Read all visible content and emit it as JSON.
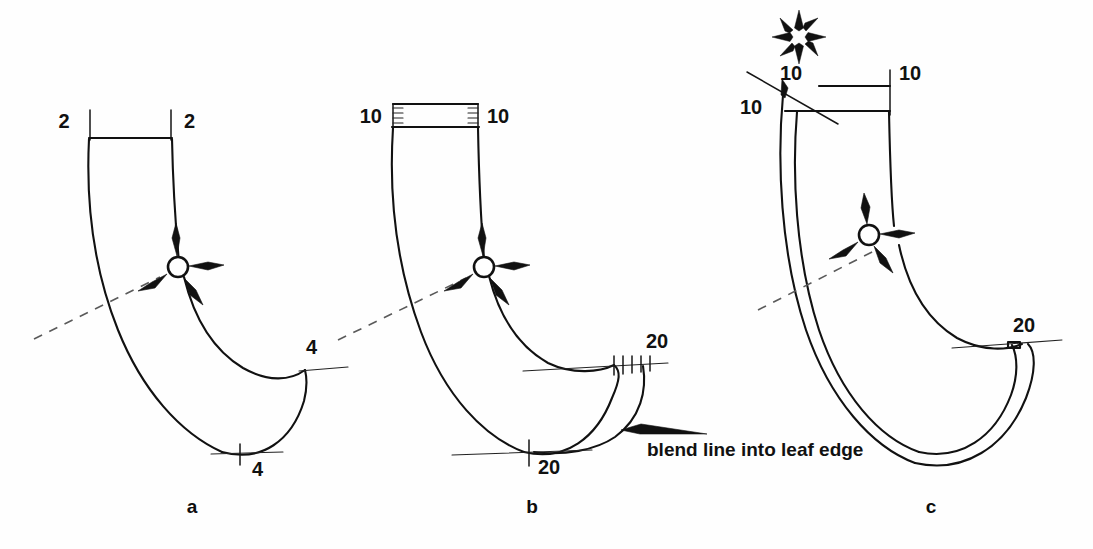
{
  "figure": {
    "background_color": "#fefefe",
    "ink_color": "#111111",
    "dash_color": "#5a5a5a"
  },
  "panels": [
    {
      "id": "a",
      "letter": "a",
      "dimensions": [
        {
          "name": "top-left",
          "value": "2"
        },
        {
          "name": "top-right",
          "value": "2"
        },
        {
          "name": "trailing-right",
          "value": "4"
        },
        {
          "name": "bottom",
          "value": "4"
        }
      ]
    },
    {
      "id": "b",
      "letter": "b",
      "dimensions": [
        {
          "name": "top-left",
          "value": "10"
        },
        {
          "name": "top-right",
          "value": "10"
        },
        {
          "name": "trailing-right",
          "value": "20"
        },
        {
          "name": "bottom",
          "value": "20"
        }
      ]
    },
    {
      "id": "c",
      "letter": "c",
      "dimensions": [
        {
          "name": "top-left-outer",
          "value": "10"
        },
        {
          "name": "top-left-inner",
          "value": "10"
        },
        {
          "name": "top-right",
          "value": "10"
        },
        {
          "name": "trailing-right",
          "value": "20"
        }
      ]
    }
  ],
  "annotations": {
    "blend_note": "blend line into leaf edge",
    "burst_symbol": "starburst-icon"
  }
}
